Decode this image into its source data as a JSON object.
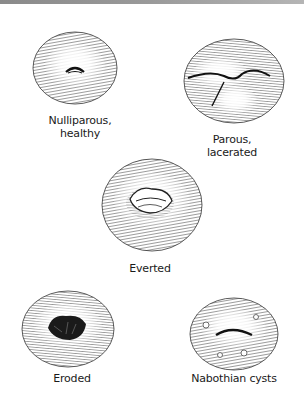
{
  "figures": [
    {
      "id": "nulliparous",
      "caption_line1": "Nulliparous,",
      "caption_line2": "healthy"
    },
    {
      "id": "parous",
      "caption_line1": "Parous,",
      "caption_line2": "lacerated"
    },
    {
      "id": "everted",
      "caption_line1": "Everted"
    },
    {
      "id": "eroded",
      "caption_line1": "Eroded"
    },
    {
      "id": "nabothian",
      "caption_line1": "Nabothian cysts"
    }
  ],
  "colors": {
    "ink": "#1a1a1a",
    "topbar": "#9a9a9a",
    "background": "#ffffff"
  }
}
